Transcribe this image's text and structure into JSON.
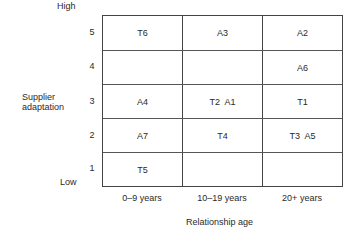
{
  "y_axis": {
    "title_line1": "Supplier",
    "title_line2": "adaptation",
    "high_label": "High",
    "low_label": "Low",
    "levels": [
      "5",
      "4",
      "3",
      "2",
      "1"
    ]
  },
  "x_axis": {
    "title": "Relationship age",
    "categories": [
      "0–9 years",
      "10–19 years",
      "20+ years"
    ]
  },
  "cells": {
    "r5": [
      "T6",
      "A3",
      "A2"
    ],
    "r4": [
      "",
      "",
      "A6"
    ],
    "r3": [
      "A4",
      "T2  A1",
      "T1"
    ],
    "r2": [
      "A7",
      "T4",
      "T3  A5"
    ],
    "r1": [
      "T5",
      "",
      ""
    ]
  },
  "colors": {
    "line": "#444444",
    "text": "#2a2a2a"
  }
}
